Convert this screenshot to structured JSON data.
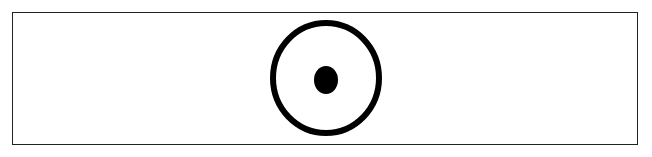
{
  "diagram": {
    "type": "symbol",
    "frame": {
      "x": 12,
      "y": 12,
      "width": 626,
      "height": 133,
      "stroke": "#222222"
    },
    "outer_circle": {
      "cx": 326,
      "cy": 78,
      "rx": 53,
      "ry": 55,
      "stroke_width": 6,
      "color": "#000000"
    },
    "center_dot": {
      "cx": 326,
      "cy": 80,
      "rx": 12,
      "ry": 14,
      "color": "#000000"
    }
  }
}
